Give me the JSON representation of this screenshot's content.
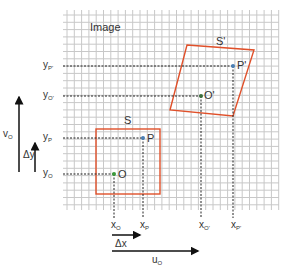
{
  "diagram": {
    "grid_label": "Image",
    "shape_original_label": "S",
    "shape_transformed_label": "S'",
    "points": {
      "O": {
        "label": "O",
        "color": "#3a9a3a"
      },
      "P": {
        "label": "P",
        "color": "#4a7fb5"
      },
      "O_prime": {
        "label": "O'",
        "color": "#3a6e3a"
      },
      "P_prime": {
        "label": "P'",
        "color": "#4a7fb5"
      }
    },
    "y_labels": {
      "y_P_prime": "y",
      "y_P_prime_sub": "P'",
      "y_O_prime": "y",
      "y_O_prime_sub": "O'",
      "y_P": "y",
      "y_P_sub": "P",
      "y_O": "y",
      "y_O_sub": "O"
    },
    "x_labels": {
      "x_O": "x",
      "x_O_sub": "O",
      "x_P": "x",
      "x_P_sub": "P",
      "x_O_prime": "x",
      "x_O_prime_sub": "O'",
      "x_P_prime": "x",
      "x_P_prime_sub": "P'"
    },
    "arrows": {
      "v_O": "v",
      "v_O_sub": "O",
      "delta_y": "Δy",
      "delta_x": "Δx",
      "u_O": "u",
      "u_O_sub": "O"
    },
    "colors": {
      "grid": "#c8c8c8",
      "shape_outline": "#e0502a",
      "dashed": "#222222",
      "arrow": "#111111"
    }
  }
}
